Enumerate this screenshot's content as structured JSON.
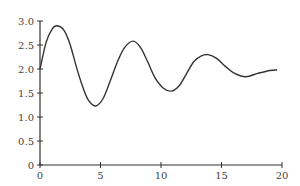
{
  "chart_data": {
    "type": "line",
    "title": "",
    "xlabel": "",
    "ylabel": "",
    "xlim": [
      0,
      20
    ],
    "ylim": [
      0,
      3.0
    ],
    "grid": false,
    "legend": null,
    "x_ticks": [
      "0",
      "5",
      "10",
      "15",
      "20"
    ],
    "y_ticks": [
      "0",
      "0.5",
      "1.0",
      "1.5",
      "2.0",
      "2.5",
      "3.0"
    ],
    "series": [
      {
        "name": "damped oscillation",
        "color": "#333333",
        "x": [
          0,
          0.5,
          1.0,
          1.4,
          2.0,
          2.5,
          3.0,
          3.5,
          4.0,
          4.6,
          5.2,
          5.8,
          6.4,
          7.0,
          7.7,
          8.3,
          8.9,
          9.5,
          10.2,
          10.9,
          11.5,
          12.1,
          12.7,
          13.3,
          13.9,
          14.6,
          15.3,
          16.0,
          17.0,
          18.0,
          19.0,
          19.6
        ],
        "y": [
          2.0,
          2.55,
          2.83,
          2.9,
          2.8,
          2.5,
          2.05,
          1.65,
          1.35,
          1.23,
          1.38,
          1.75,
          2.15,
          2.45,
          2.58,
          2.45,
          2.15,
          1.82,
          1.6,
          1.54,
          1.65,
          1.9,
          2.15,
          2.27,
          2.3,
          2.22,
          2.06,
          1.92,
          1.84,
          1.91,
          1.97,
          1.98
        ]
      }
    ]
  }
}
